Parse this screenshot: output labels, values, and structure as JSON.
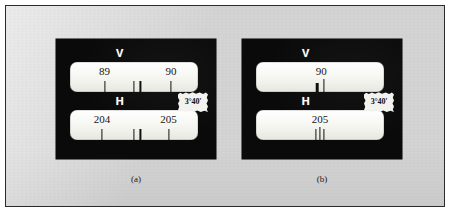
{
  "figure": {
    "background_color": "#d4d4d4",
    "border_color": "#2b2b2b",
    "panel_color": "#0a0a0a",
    "window_color": "#f6f6f2"
  },
  "panels": [
    {
      "id": "a",
      "caption": "(a)",
      "tag": {
        "label": "3°40'",
        "name": "angle-tag"
      },
      "windows": [
        {
          "axis_letter": "V",
          "name": "vertical-circle-window",
          "numerals": [
            {
              "text": "89",
              "x_pct": 27
            },
            {
              "text": "90",
              "x_pct": 79
            }
          ],
          "ticks": [
            {
              "x_pct": 27,
              "height": 11,
              "width": 1.2
            },
            {
              "x_pct": 50,
              "height": 11,
              "width": 1.2
            },
            {
              "x_pct": 55,
              "height": 11,
              "width": 1.2
            },
            {
              "x_pct": 79,
              "height": 11,
              "width": 1.2
            }
          ]
        },
        {
          "axis_letter": "H",
          "name": "horizontal-circle-window",
          "numerals": [
            {
              "text": "204",
              "x_pct": 25
            },
            {
              "text": "205",
              "x_pct": 77
            }
          ],
          "ticks": [
            {
              "x_pct": 25,
              "height": 11,
              "width": 1.2
            },
            {
              "x_pct": 50,
              "height": 11,
              "width": 1.2
            },
            {
              "x_pct": 55,
              "height": 11,
              "width": 1.2
            },
            {
              "x_pct": 77,
              "height": 11,
              "width": 1.2
            }
          ]
        }
      ]
    },
    {
      "id": "b",
      "caption": "(b)",
      "tag": {
        "label": "3°40'",
        "name": "angle-tag"
      },
      "windows": [
        {
          "axis_letter": "V",
          "name": "vertical-circle-window",
          "numerals": [
            {
              "text": "90",
              "x_pct": 51
            }
          ],
          "ticks": [
            {
              "x_pct": 48,
              "height": 9,
              "width": 2.6
            },
            {
              "x_pct": 53,
              "height": 13,
              "width": 1.2
            }
          ]
        },
        {
          "axis_letter": "H",
          "name": "horizontal-circle-window",
          "numerals": [
            {
              "text": "205",
              "x_pct": 50
            }
          ],
          "ticks": [
            {
              "x_pct": 47,
              "height": 11,
              "width": 1.2
            },
            {
              "x_pct": 50,
              "height": 13,
              "width": 1.2
            },
            {
              "x_pct": 53,
              "height": 11,
              "width": 1.2
            }
          ]
        }
      ]
    }
  ]
}
